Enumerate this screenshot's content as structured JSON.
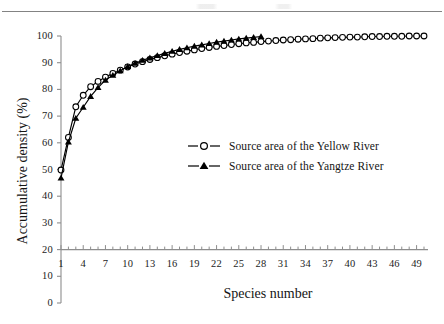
{
  "chart_data": {
    "type": "line",
    "title": "",
    "xlabel": "Species number",
    "ylabel": "Accumulative density (%)",
    "xlim": [
      1,
      50
    ],
    "ylim": [
      0,
      100
    ],
    "yticks": [
      0,
      10,
      20,
      30,
      40,
      50,
      60,
      70,
      80,
      90,
      100
    ],
    "xticks": [
      1,
      4,
      7,
      10,
      13,
      16,
      19,
      22,
      25,
      28,
      31,
      34,
      37,
      40,
      43,
      46,
      49
    ],
    "grid": false,
    "axis_baseline_value": 20,
    "legend_position": "center",
    "series": [
      {
        "name": "Source area of the Yellow River",
        "marker": "open-circle",
        "color": "#000000",
        "x": [
          1,
          2,
          3,
          4,
          5,
          6,
          7,
          8,
          9,
          10,
          11,
          12,
          13,
          14,
          15,
          16,
          17,
          18,
          19,
          20,
          21,
          22,
          23,
          24,
          25,
          26,
          27,
          28,
          29,
          30,
          31,
          32,
          33,
          34,
          35,
          36,
          37,
          38,
          39,
          40,
          41,
          42,
          43,
          44,
          45,
          46,
          47,
          48,
          49,
          50
        ],
        "values": [
          49.8,
          62.0,
          73.5,
          77.8,
          81.0,
          83.0,
          84.6,
          86.0,
          87.2,
          88.4,
          89.5,
          90.4,
          91.2,
          91.9,
          92.6,
          93.2,
          93.8,
          94.3,
          94.8,
          95.3,
          95.7,
          96.1,
          96.4,
          96.8,
          97.1,
          97.4,
          97.6,
          97.9,
          98.1,
          98.3,
          98.5,
          98.6,
          98.8,
          98.9,
          99.0,
          99.2,
          99.3,
          99.4,
          99.5,
          99.6,
          99.6,
          99.7,
          99.8,
          99.8,
          99.9,
          99.9,
          99.9,
          100.0,
          100.0,
          100.0
        ]
      },
      {
        "name": "Source area of the Yangtze River",
        "marker": "filled-triangle",
        "color": "#000000",
        "x": [
          1,
          2,
          3,
          4,
          5,
          6,
          7,
          8,
          9,
          10,
          11,
          12,
          13,
          14,
          15,
          16,
          17,
          18,
          19,
          20,
          21,
          22,
          23,
          24,
          25,
          26,
          27,
          28
        ],
        "values": [
          46.8,
          60.3,
          69.2,
          73.3,
          77.4,
          80.7,
          83.5,
          85.3,
          87.0,
          88.6,
          89.8,
          90.9,
          91.8,
          92.7,
          93.5,
          94.3,
          95.0,
          95.6,
          96.2,
          96.7,
          97.2,
          97.7,
          98.1,
          98.5,
          98.9,
          99.2,
          99.5,
          99.8
        ]
      }
    ]
  },
  "legend": {
    "items": [
      {
        "label": "Source area of the Yellow River",
        "marker": "open-circle"
      },
      {
        "label": "Source area of the Yangtze River",
        "marker": "filled-triangle"
      }
    ]
  },
  "axis_titles": {
    "y": "Accumulative density (%)",
    "x": "Species number"
  },
  "colors": {
    "ink": "#000000",
    "axis": "#8d8d8d",
    "text": "#1a1a1a"
  }
}
